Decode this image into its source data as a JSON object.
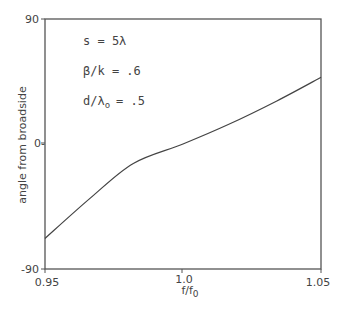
{
  "chart_data": {
    "type": "line",
    "title": "",
    "xlabel": "f/f0",
    "ylabel": "angle from broadside",
    "xlim": [
      0.95,
      1.05
    ],
    "ylim": [
      -90,
      90
    ],
    "x_ticks": [
      "0.95",
      "1.0",
      "1.05"
    ],
    "y_ticks": [
      "90",
      "0-",
      "-90"
    ],
    "grid": false,
    "annotations": [
      "s = 5λ",
      "β/k = .6",
      "d/λo = .5"
    ],
    "series": [
      {
        "name": "beam angle",
        "x": [
          0.95,
          0.9664,
          0.982,
          1.0,
          1.0164,
          1.034,
          1.05
        ],
        "y": [
          -68,
          -39,
          -14,
          0,
          14,
          31,
          48
        ]
      }
    ]
  },
  "axes": {
    "xlabel_main": "f/f",
    "xlabel_sub": "0",
    "ylabel": "angle from broadside",
    "xticks": {
      "t0": "0.95",
      "t1": "1.0",
      "t2": "1.05"
    },
    "yticks": {
      "top": "90",
      "mid": "0-",
      "bottom": "-90"
    }
  },
  "annotations": {
    "s": "s = 5λ",
    "beta": "β/k = .6",
    "d_main": "d/λ",
    "d_sub": "o",
    "d_val": "= .5"
  }
}
